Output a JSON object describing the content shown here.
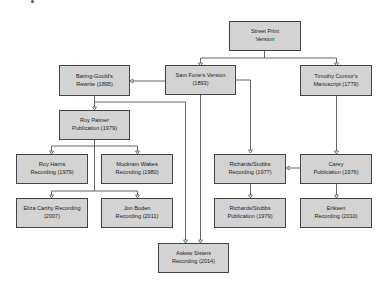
{
  "diagram": {
    "nodes": {
      "street_print": {
        "line1": "Street Print",
        "line2": "Version"
      },
      "sam_fone": {
        "line1": "Sam Fone's Version",
        "line2": "(1893)"
      },
      "timothy_connor": {
        "line1": "Timothy Connor's",
        "line2": "Manuscript (1779)"
      },
      "baring_gould": {
        "line1": "Baring-Gould's",
        "line2": "Rewrite (1895)"
      },
      "roy_palmer": {
        "line1": "Roy Palmer",
        "line2": "Publication (1979)"
      },
      "roy_harris": {
        "line1": "Roy Harris",
        "line2": "Recording (1979)"
      },
      "muckram_wakes": {
        "line1": "Muckram Wakes",
        "line2": "Recording (1980)"
      },
      "eliza_carthy": {
        "line1": "Eliza Carthy Recording",
        "line2": "(2007)"
      },
      "jon_boden": {
        "line1": "Jon Boden",
        "line2": "Recording (2011)"
      },
      "askew_sisters": {
        "line1": "Askew Sisters",
        "line2": "Recording (2014)"
      },
      "richards_stubbs_rec": {
        "line1": "Richards/Stubbs",
        "line2": "Recording (1977)"
      },
      "richards_stubbs_pub": {
        "line1": "Richards/Stubbs",
        "line2": "Publication (1979)"
      },
      "carey": {
        "line1": "Carey",
        "line2": "Publication (1976)"
      },
      "eriksen": {
        "line1": "Eriksen",
        "line2": "Recording (2010)"
      }
    },
    "edges": [
      {
        "from": "street_print",
        "to": "sam_fone"
      },
      {
        "from": "street_print",
        "to": "timothy_connor"
      },
      {
        "from": "sam_fone",
        "to": "baring_gould"
      },
      {
        "from": "sam_fone",
        "to": "askew_sisters"
      },
      {
        "from": "sam_fone",
        "to": "richards_stubbs_rec"
      },
      {
        "from": "baring_gould",
        "to": "roy_palmer"
      },
      {
        "from": "baring_gould",
        "to": "askew_sisters"
      },
      {
        "from": "roy_palmer",
        "to": "roy_harris"
      },
      {
        "from": "roy_palmer",
        "to": "muckram_wakes"
      },
      {
        "from": "roy_palmer",
        "to": "eliza_carthy"
      },
      {
        "from": "roy_palmer",
        "to": "jon_boden"
      },
      {
        "from": "timothy_connor",
        "to": "carey"
      },
      {
        "from": "carey",
        "to": "richards_stubbs_rec"
      },
      {
        "from": "carey",
        "to": "eriksen"
      },
      {
        "from": "richards_stubbs_rec",
        "to": "richards_stubbs_pub"
      }
    ]
  }
}
